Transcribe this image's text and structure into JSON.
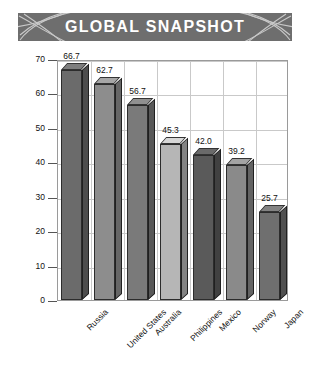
{
  "banner": {
    "title": "GLOBAL SNAPSHOT",
    "background_color": "#6e6e6e",
    "text_color": "#ffffff",
    "deco_left_icon": "swoosh-arcs-icon",
    "deco_right_icon": "swoosh-arcs-icon"
  },
  "chart_data": {
    "type": "bar",
    "title": "GLOBAL SNAPSHOT",
    "xlabel": "",
    "ylabel": "Percent Claiming Science Will Help",
    "ylim": [
      0,
      70
    ],
    "ytick_step": 10,
    "yticks": [
      "0",
      "10",
      "20",
      "30",
      "40",
      "50",
      "60",
      "70"
    ],
    "grid": true,
    "legend": null,
    "categories": [
      "Russia",
      "United States",
      "Australia",
      "Philippines",
      "Mexico",
      "Norway",
      "Japan"
    ],
    "values": [
      66.7,
      62.7,
      56.7,
      45.3,
      42.0,
      39.2,
      25.7
    ],
    "value_labels": [
      "66.7",
      "62.7",
      "56.7",
      "45.3",
      "42.0",
      "39.2",
      "25.7"
    ],
    "bar_colors": [
      "#6b6b6b",
      "#8d8d8d",
      "#7a7a7a",
      "#b6b6b6",
      "#5a5a5a",
      "#8a8a8a",
      "#6f6f6f"
    ],
    "bar_outline_color": "#2c2c2c",
    "plot_border_color": "#9a9a9a",
    "gridline_color": "#c9c9c9"
  }
}
